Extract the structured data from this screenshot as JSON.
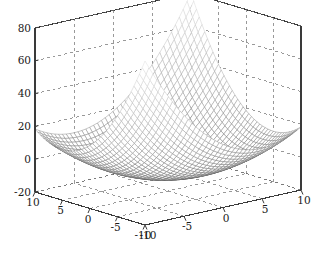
{
  "chart_data": {
    "type": "surface",
    "title": "",
    "xlabel": "",
    "ylabel": "",
    "zlabel": "",
    "projection": "3d-mesh",
    "colormap": "grayscale-light-high-dark-low",
    "grid": true,
    "grid_style": "dashed",
    "box": true,
    "view": {
      "azimuth": -37.5,
      "elevation": 30
    },
    "surface_function": "z = x^2 - y^2 (hyperbolic-paraboloid saddle)",
    "mesh_resolution": {
      "nx": 41,
      "ny": 41
    },
    "x": {
      "label": "",
      "min": -10,
      "max": 10,
      "ticks": [
        -10,
        -5,
        0,
        5,
        10
      ],
      "tick_labels": [
        "-10",
        "-5",
        "0",
        "5",
        "10"
      ]
    },
    "y": {
      "label": "",
      "min": -10,
      "max": 10,
      "ticks": [
        -10,
        -5,
        0,
        5,
        10
      ],
      "tick_labels": [
        "-10",
        "-5",
        "0",
        "5",
        "10"
      ]
    },
    "z": {
      "label": "",
      "min": -20,
      "max": 80,
      "ticks": [
        -20,
        0,
        20,
        40,
        60,
        80
      ],
      "tick_labels": [
        "-20",
        "0",
        "20",
        "40",
        "60",
        "80"
      ]
    },
    "zlim": [
      -20,
      80
    ],
    "xlim": [
      -10,
      10
    ],
    "ylim": [
      -10,
      10
    ]
  },
  "axis": {
    "z_ticks": [
      "80",
      "60",
      "40",
      "20",
      "0",
      "-20"
    ],
    "x_ticks": [
      "10",
      "5",
      "0",
      "-5",
      "-10"
    ],
    "y_ticks": [
      "-10",
      "-5",
      "0",
      "5",
      "10"
    ]
  },
  "colors": {
    "background": "#ffffff",
    "axis_line": "#3a3a3a",
    "grid_line": "#6e6e6e",
    "mesh_low": "#5a5a5a",
    "mesh_high": "#f2f2f2",
    "tick_text": "#1a1a1a"
  }
}
